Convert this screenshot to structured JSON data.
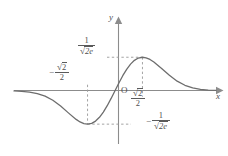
{
  "chart_data": {
    "type": "line",
    "title": "",
    "xlabel": "x",
    "ylabel": "y",
    "function": "f(x) = x * e^(-x^2)",
    "xlim": [
      -2.6,
      2.6
    ],
    "ylim": [
      -0.62,
      0.62
    ],
    "grid": false,
    "legend": null,
    "origin_label": "O",
    "series": [
      {
        "name": "x e^{-x^2}",
        "color": "#6d6d6d",
        "x": [
          -2.6,
          -2.4,
          -2.2,
          -2.0,
          -1.8,
          -1.6,
          -1.4,
          -1.2,
          -1.0,
          -0.9,
          -0.8,
          -0.7071,
          -0.6,
          -0.5,
          -0.4,
          -0.3,
          -0.2,
          -0.1,
          0.0,
          0.1,
          0.2,
          0.3,
          0.4,
          0.5,
          0.6,
          0.7071,
          0.8,
          0.9,
          1.0,
          1.2,
          1.4,
          1.6,
          1.8,
          2.0,
          2.2,
          2.4,
          2.6
        ],
        "y": [
          -0.003,
          -0.0074,
          -0.0175,
          -0.0366,
          -0.0698,
          -0.1222,
          -0.1971,
          -0.2842,
          -0.3679,
          -0.4005,
          -0.4216,
          -0.4289,
          -0.419,
          -0.3894,
          -0.3409,
          -0.2742,
          -0.1922,
          -0.099,
          0.0,
          0.099,
          0.1922,
          0.2742,
          0.3409,
          0.3894,
          0.419,
          0.4289,
          0.4216,
          0.4005,
          0.3679,
          0.2842,
          0.1971,
          0.1222,
          0.0698,
          0.0366,
          0.0175,
          0.0074,
          0.003
        ]
      }
    ],
    "extrema": [
      {
        "kind": "maximum",
        "x": 0.7071,
        "y": 0.4289,
        "x_label": "√2/2",
        "y_label": "1/√(2e)"
      },
      {
        "kind": "minimum",
        "x": -0.7071,
        "y": -0.4289,
        "x_label": "-√2/2",
        "y_label": "-1/√(2e)"
      }
    ],
    "annotations": {
      "y_max_label": {
        "sign": "",
        "numerator": "1",
        "denominator_radicand": "2e",
        "text": "1/√(2e)"
      },
      "x_min_label": {
        "sign": "−",
        "numerator": "√2",
        "denominator": "2",
        "text": "-√2/2"
      },
      "x_max_label": {
        "sign": "",
        "numerator": "√2",
        "denominator": "2",
        "text": "√2/2"
      },
      "y_min_label": {
        "sign": "−",
        "numerator": "1",
        "denominator_radicand": "2e",
        "text": "-1/√(2e)"
      }
    },
    "guide_lines": [
      {
        "from": "y-axis",
        "to": "maximum",
        "orientation": "horizontal",
        "style": "dashed"
      },
      {
        "from": "x-axis",
        "to": "maximum",
        "orientation": "vertical",
        "style": "dashed"
      },
      {
        "from": "y-axis",
        "to": "minimum",
        "orientation": "horizontal",
        "style": "dashed"
      },
      {
        "from": "x-axis",
        "to": "minimum",
        "orientation": "vertical",
        "style": "dashed"
      }
    ],
    "symbols": {
      "radical": "√",
      "minus": "−",
      "two": "2",
      "one": "1",
      "two_e": "2e",
      "e": "e",
      "x_axis_name": "x",
      "y_axis_name": "y"
    },
    "colors": {
      "curve": "#6d6d6d",
      "axis": "#8c8c8c",
      "dashed": "#9a9a9a",
      "text": "#4f4f4f",
      "background": "#ffffff"
    }
  }
}
